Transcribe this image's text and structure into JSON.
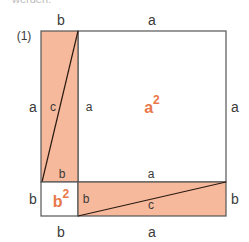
{
  "header": {
    "cut_text": "werden.",
    "figure_number": "(1)"
  },
  "colors": {
    "fill": "#f6b99c",
    "stroke": "#555555",
    "area_label": "#e8784a"
  },
  "labels": {
    "top_b": "b",
    "top_a": "a",
    "left_a": "a",
    "left_b": "b",
    "right_a": "a",
    "right_b": "b",
    "bottom_b": "b",
    "bottom_a": "a",
    "vrect_c": "c",
    "vrect_a": "a",
    "vrect_b": "b",
    "hrect_a": "a",
    "hrect_b": "b",
    "hrect_c": "c",
    "big_square": "a",
    "big_square_exp": "2",
    "small_square": "b",
    "small_square_exp": "2"
  }
}
